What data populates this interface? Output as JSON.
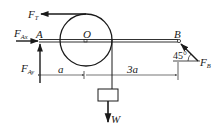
{
  "diagram": {
    "type": "statics free-body diagram",
    "points": {
      "A": "A",
      "O": "O",
      "B": "B"
    },
    "forces": {
      "tension": {
        "main": "F",
        "sub": "T"
      },
      "A_horizontal": {
        "main": "F",
        "sub": "Ax"
      },
      "A_vertical": {
        "main": "F",
        "sub": "Ay"
      },
      "B": {
        "main": "F",
        "sub": "B"
      },
      "weight": "W"
    },
    "dimensions": {
      "left_segment": "a",
      "right_segment": "3a"
    },
    "angle": "45°",
    "colors": {
      "stroke": "#1a1a1a",
      "background": "#ffffff"
    }
  }
}
